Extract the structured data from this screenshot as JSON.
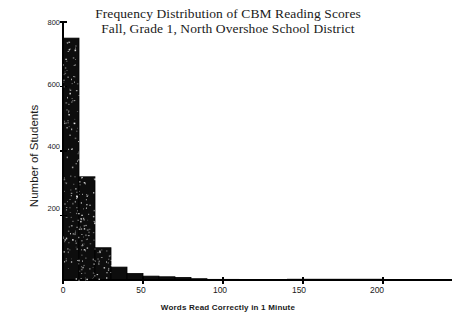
{
  "chart_data": {
    "type": "bar",
    "title": "Frequency Distribution of CBM Reading Scores",
    "subtitle": "Fall, Grade 1, North Overshoe School District",
    "title_lines": [
      "Frequency Distribution of CBM Reading Scores",
      "Fall, Grade 1, North Overshoe School District"
    ],
    "xlabel": "Words Read Correctly in 1 Minute",
    "ylabel": "Number of Students",
    "xlim": [
      0,
      230
    ],
    "ylim": [
      0,
      800
    ],
    "xticks": [
      0,
      50,
      100,
      150,
      200
    ],
    "xtick_labels": [
      "0",
      "50",
      "100",
      "150",
      "200"
    ],
    "yticks": [
      200,
      400,
      600,
      800
    ],
    "ytick_labels": [
      "200",
      "400",
      "600",
      "800"
    ],
    "grid": false,
    "legend": false,
    "bin_width": 10,
    "bin_edges": [
      0,
      10,
      20,
      30,
      40,
      50,
      60,
      70,
      80,
      90,
      100,
      110,
      120,
      130,
      140
    ],
    "categories": [
      "0-10",
      "10-20",
      "20-30",
      "30-40",
      "40-50",
      "50-60",
      "60-70",
      "70-80",
      "80-90",
      "90-100",
      "100-110",
      "110-120",
      "120-130",
      "130-140"
    ],
    "values": [
      750,
      320,
      100,
      40,
      20,
      12,
      10,
      8,
      4,
      2,
      2,
      1,
      1,
      1
    ],
    "bar_color": "#0d0d0d",
    "bar_edge_color": "#000000",
    "axis_color": "#000000",
    "background_color": "#ffffff",
    "series": [
      {
        "name": "Number of Students",
        "values": [
          750,
          320,
          100,
          40,
          20,
          12,
          10,
          8,
          4,
          2,
          2,
          1,
          1,
          1
        ]
      }
    ]
  },
  "figure": {
    "caption": ""
  }
}
